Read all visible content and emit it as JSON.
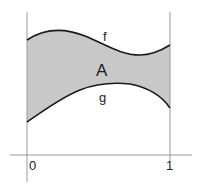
{
  "figure": {
    "labels": {
      "upper_curve": "f",
      "lower_curve": "g",
      "region": "A",
      "x_start": "0",
      "x_end": "1"
    },
    "colors": {
      "fill": "#c8c8c8",
      "curve": "#1a1a1a",
      "axis": "#999999"
    }
  }
}
